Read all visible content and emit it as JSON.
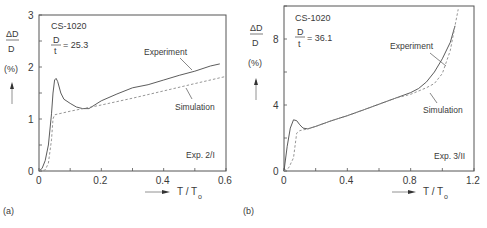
{
  "chart_data": [
    {
      "type": "line",
      "panel_label": "(a)",
      "title": "",
      "annotations": [
        "CS-1020",
        "D/t = 25.3",
        "Exp. 2/I"
      ],
      "specimen": "CS-1020",
      "d_over_t": "25.3",
      "experiment_id": "Exp. 2/I",
      "xlabel": "T / To",
      "ylabel": "ΔD/D (%)",
      "xlim": [
        0,
        0.6
      ],
      "ylim": [
        0,
        3
      ],
      "xticks": [
        "0",
        "0.2",
        "0.4",
        "0.6"
      ],
      "yticks": [
        "0",
        "1",
        "2",
        "3"
      ],
      "grid": false,
      "legend": "inline labels",
      "series": [
        {
          "name": "Experiment",
          "style": "solid",
          "x": [
            0,
            0.01,
            0.02,
            0.03,
            0.04,
            0.045,
            0.05,
            0.055,
            0.06,
            0.07,
            0.08,
            0.1,
            0.12,
            0.14,
            0.16,
            0.2,
            0.25,
            0.3,
            0.35,
            0.4,
            0.45,
            0.5,
            0.55,
            0.58
          ],
          "y": [
            0,
            0.05,
            0.2,
            0.5,
            1.1,
            1.5,
            1.75,
            1.78,
            1.72,
            1.5,
            1.38,
            1.3,
            1.23,
            1.2,
            1.2,
            1.35,
            1.48,
            1.6,
            1.66,
            1.75,
            1.84,
            1.92,
            2.02,
            2.06
          ]
        },
        {
          "name": "Simulation",
          "style": "dashed",
          "x": [
            0,
            0.02,
            0.03,
            0.04,
            0.045,
            0.05,
            0.1,
            0.2,
            0.3,
            0.4,
            0.5,
            0.6
          ],
          "y": [
            0,
            0.02,
            0.15,
            0.6,
            1.0,
            1.08,
            1.15,
            1.27,
            1.4,
            1.54,
            1.68,
            1.82
          ]
        }
      ]
    },
    {
      "type": "line",
      "panel_label": "(b)",
      "title": "",
      "annotations": [
        "CS-1020",
        "D/t = 36.1",
        "Exp. 3/II"
      ],
      "specimen": "CS-1020",
      "d_over_t": "36.1",
      "experiment_id": "Exp. 3/II",
      "xlabel": "T / To",
      "ylabel": "ΔD/D (%)",
      "xlim": [
        0,
        1.2
      ],
      "ylim": [
        0,
        10
      ],
      "xticks": [
        "0",
        "0.4",
        "0.8",
        "1.2"
      ],
      "yticks": [
        "0",
        "4",
        "8"
      ],
      "grid": false,
      "legend": "inline labels",
      "series": [
        {
          "name": "Experiment",
          "style": "solid",
          "x": [
            0,
            0.02,
            0.04,
            0.06,
            0.08,
            0.1,
            0.12,
            0.15,
            0.2,
            0.3,
            0.4,
            0.5,
            0.6,
            0.7,
            0.8,
            0.85,
            0.9,
            0.95,
            1.0,
            1.05,
            1.08
          ],
          "y": [
            0,
            1.5,
            2.6,
            3.1,
            3.05,
            2.8,
            2.6,
            2.55,
            2.7,
            3.05,
            3.35,
            3.7,
            4.05,
            4.4,
            4.75,
            5.0,
            5.4,
            6.0,
            6.8,
            7.8,
            8.8
          ]
        },
        {
          "name": "Simulation",
          "style": "dashed",
          "x": [
            0,
            0.03,
            0.06,
            0.08,
            0.1,
            0.15,
            0.2,
            0.3,
            0.4,
            0.5,
            0.6,
            0.7,
            0.8,
            0.85,
            0.9,
            0.95,
            1.0,
            1.05,
            1.08,
            1.1
          ],
          "y": [
            0,
            0.2,
            0.8,
            2.3,
            2.45,
            2.55,
            2.7,
            3.05,
            3.35,
            3.7,
            4.05,
            4.4,
            4.65,
            4.85,
            5.05,
            5.3,
            5.9,
            7.3,
            8.8,
            9.8
          ]
        }
      ]
    }
  ],
  "panels": {
    "a": {
      "label": "(a)",
      "specimen": "CS-1020",
      "ratio_num": "D",
      "ratio_den": "t",
      "ratio_value": "= 25.3",
      "exp_id": "Exp. 2/I",
      "ylabel_num": "ΔD",
      "ylabel_den": "D",
      "ylabel_unit": "(%)",
      "xlabel_main": "T / T",
      "xlabel_sub": "o",
      "series_labels": [
        "Experiment",
        "Simulation"
      ],
      "xticks": [
        "0",
        "0.2",
        "0.4",
        "0.6"
      ],
      "yticks": [
        "0",
        "1",
        "2",
        "3"
      ]
    },
    "b": {
      "label": "(b)",
      "specimen": "CS-1020",
      "ratio_num": "D",
      "ratio_den": "t",
      "ratio_value": "= 36.1",
      "exp_id": "Exp. 3/II",
      "ylabel_num": "ΔD",
      "ylabel_den": "D",
      "ylabel_unit": "(%)",
      "xlabel_main": "T / T",
      "xlabel_sub": "o",
      "series_labels": [
        "Experiment",
        "Simulation"
      ],
      "xticks": [
        "0",
        "0.4",
        "0.8",
        "1.2"
      ],
      "yticks": [
        "0",
        "4",
        "8"
      ]
    }
  },
  "colors": {
    "axis": "#555555",
    "experiment": "#4a4a4a",
    "simulation": "#8a8a8a",
    "text": "#3a3a3a"
  }
}
